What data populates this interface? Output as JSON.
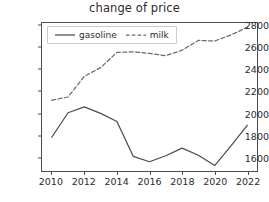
{
  "chart_data": {
    "type": "line",
    "title": "change of price",
    "xlabel": "",
    "ylabel": "",
    "x": [
      2010,
      2011,
      2012,
      2013,
      2014,
      2015,
      2016,
      2017,
      2018,
      2019,
      2020,
      2021,
      2022
    ],
    "xlim": [
      2009.4,
      2022.6
    ],
    "ylim": [
      1470,
      2830
    ],
    "xticks": [
      2010,
      2012,
      2014,
      2016,
      2018,
      2020,
      2022
    ],
    "xtick_labels": [
      "2010",
      "2012",
      "2014",
      "2016",
      "2018",
      "2020",
      "2022"
    ],
    "yticks": [
      1600,
      1800,
      2000,
      2200,
      2400,
      2600,
      2800
    ],
    "ytick_labels": [
      "1600",
      "1800",
      "2000",
      "2200",
      "2400",
      "2600",
      "2800"
    ],
    "grid": false,
    "legend_position": "upper left",
    "series": [
      {
        "name": "gasoline",
        "style": "solid",
        "color": "#4d4d4d",
        "values": [
          1780,
          2005,
          2060,
          2000,
          1925,
          1605,
          1555,
          1610,
          1680,
          1615,
          1520,
          1700,
          1890
        ]
      },
      {
        "name": "milk",
        "style": "dashed",
        "color": "#6b6b6b",
        "values": [
          2120,
          2150,
          2340,
          2420,
          2560,
          2565,
          2550,
          2530,
          2580,
          2670,
          2665,
          2720,
          2790
        ]
      }
    ]
  },
  "legend": {
    "items": [
      {
        "label": "gasoline",
        "style": "solid"
      },
      {
        "label": "milk",
        "style": "dashed"
      }
    ]
  }
}
